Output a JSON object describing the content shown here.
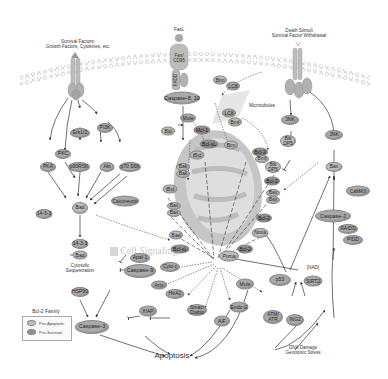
{
  "diagram": {
    "inputs": {
      "survival_factors": "Survival Factors:\nGrowth Factors, Cytokines, etc.",
      "fasl": "FasL",
      "death_stimuli": "Death Stimuli\nSurvival Factor Withdrawal",
      "dna_damage": "DNA Damage\nGenotoxic Stress"
    },
    "receptors": {
      "fas_cd95": "Fas/\nCD95",
      "fadd": "FADD"
    },
    "labels": {
      "microtubules": "Microtubules",
      "cytosolic": "Cytosolic\nSequestration",
      "nad": "[NAD]",
      "apoptosis": "Apoptosis",
      "watermark": "Cell Signaling"
    },
    "nodes": {
      "erk12": "Erk1/2",
      "pi3k": "PI3K",
      "pkc": "PKC",
      "pka": "PKA",
      "p90rsk": "p90RSK",
      "akt": "Akt",
      "p70s6k": "p70 S6K",
      "bad_main": "Bad",
      "calcineurin": "Calcineurin",
      "p1433_a": "14-3-3",
      "p1433_b": "14-3-3",
      "bad_seq": "Bad",
      "casp810": "Caspase-8, 10",
      "bim_top": "Bim",
      "lc8_top": "LC8",
      "lc8_mid": "LC8",
      "bmf_mid": "Bmf",
      "mule_top": "Mule",
      "mcl1": "Mcl-1",
      "bid": "Bid",
      "bclxl_top": "Bcl-xL",
      "bim_mid": "Bim",
      "tbid_a": "tBid",
      "bak": "Bak",
      "bak2": "Bak",
      "tbid_b": "tBid",
      "bax_a": "Bax",
      "bax_b": "Bax",
      "bad_mito": "Bad",
      "bclxl_low": "Bcl-xL",
      "jnk_a": "JNK",
      "jnk_b": "JNK",
      "bik_dp5_a": "Bik\nDP5",
      "bcl2_bmf": "Bcl-2",
      "bmf_b": "Bmf",
      "bik_dp5_b": "Bik\nDP5",
      "bcl2_a": "Bcl-2",
      "bax_c": "Bax",
      "bax_d": "Bax",
      "bcl2_b": "Bcl-2",
      "noxa": "Noxa",
      "bcl2_c": "Bcl-2",
      "puma": "Puma",
      "bax_right": "Bax",
      "camk2": "CaMKII",
      "casp2": "Caspase-2",
      "raidd": "RAIDD",
      "pidd": "PIDD",
      "sirt2": "SIRT2",
      "p53": "p53",
      "atm_atr": "ATM/\nATR",
      "ing2": "ING2",
      "mule_low": "Mule",
      "endog": "Endo G",
      "aif": "AIF",
      "smac": "Smac/\nDiablo",
      "htra2": "HtrA2",
      "arts": "Arts",
      "xiap": "XIAP",
      "cytoc": "Cyto c",
      "apaf1": "Apaf-1",
      "casp9": "Caspase-9",
      "hsp90": "HSP90",
      "casp3": "Caspase-3",
      "bad_seq_label": "Bad"
    },
    "legend": {
      "title": "Bcl-2 Family",
      "items": [
        {
          "label": "Pro-Apoptotic",
          "color": "#bdbdbd"
        },
        {
          "label": "Pro-Survival",
          "color": "#8f8f8f"
        }
      ]
    },
    "colors": {
      "node": "#a9a9a9",
      "membrane": "#c8c8c8",
      "mito_outer": "#c6c6c6",
      "mito_inner": "#dcdcdc",
      "line": "#333333"
    }
  }
}
